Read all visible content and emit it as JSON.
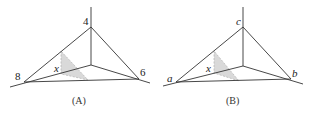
{
  "figure": {
    "panels": [
      {
        "caption": "(A)",
        "labels": {
          "top": "4",
          "left": "8",
          "right": "6",
          "slice": "x"
        },
        "italic": false
      },
      {
        "caption": "(B)",
        "labels": {
          "top": "c",
          "left": "a",
          "right": "b",
          "slice": "x"
        },
        "italic": true
      }
    ],
    "colors": {
      "line": "#333333",
      "shade": "#d9d9d9",
      "dash": "#999999"
    }
  }
}
